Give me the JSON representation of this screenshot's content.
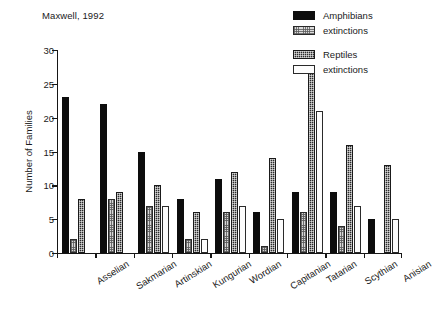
{
  "chart_data": {
    "type": "bar",
    "title": "Maxwell, 1992",
    "xlabel": "",
    "ylabel": "Number of Families",
    "ylim": [
      0,
      30
    ],
    "yticks": [
      0,
      5,
      10,
      15,
      20,
      25,
      30
    ],
    "grid": false,
    "legend_position": "top-right",
    "categories": [
      "Asselian",
      "Sakmarian",
      "Artinskian",
      "Kungurian",
      "Wordian",
      "Capitanian",
      "Tatarian",
      "Scythian",
      "Anisian"
    ],
    "series": [
      {
        "name": "Amphibians",
        "fill": "solid-black",
        "color": "#0d0d0d",
        "values": [
          23,
          22,
          15,
          8,
          11,
          6,
          9,
          9,
          5
        ]
      },
      {
        "name": "extinctions",
        "fill": "light-hatched",
        "color": "#d7d7d7",
        "values": [
          2,
          8,
          7,
          2,
          6,
          1,
          6,
          4,
          0
        ]
      },
      {
        "name": "Reptiles",
        "fill": "dark-checkered",
        "color": "#2b2b2b",
        "values": [
          8,
          9,
          10,
          6,
          12,
          14,
          27,
          16,
          13
        ]
      },
      {
        "name": "extinctions",
        "fill": "white-outlined",
        "color": "#fdfdfd",
        "values": [
          0,
          0,
          7,
          2,
          7,
          5,
          21,
          7,
          5
        ]
      }
    ]
  },
  "legend": {
    "entries": [
      {
        "label": "Amphibians",
        "swatch": "amphibians"
      },
      {
        "label": "extinctions",
        "swatch": "amph-ext"
      },
      {
        "label": "Reptiles",
        "swatch": "reptiles"
      },
      {
        "label": "extinctions",
        "swatch": "rept-ext"
      }
    ]
  }
}
